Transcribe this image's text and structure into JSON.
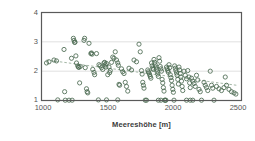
{
  "chart_data": {
    "type": "scatter",
    "title": "",
    "xlabel": "Meereshöhe [m]",
    "ylabel": "Vegetationsindex",
    "xlim": [
      1000,
      2600
    ],
    "ylim": [
      1,
      4
    ],
    "xticks": [
      1000,
      1500,
      2000,
      2500
    ],
    "yticks": [
      1,
      2,
      3,
      4
    ],
    "grid": "horizontal-only",
    "gridlines_y": [
      2,
      3
    ],
    "legend": "none",
    "marker": "open-circle",
    "marker_color": "#4c6a52",
    "trendline": {
      "style": "dashed",
      "color": "#9aaf9c",
      "x": [
        1040,
        2560
      ],
      "y": [
        2.38,
        1.52
      ]
    },
    "points": [
      [
        1040,
        2.28
      ],
      [
        1060,
        2.32
      ],
      [
        1100,
        2.38
      ],
      [
        1120,
        2.35
      ],
      [
        1130,
        1.02
      ],
      [
        1180,
        2.74
      ],
      [
        1185,
        1.3
      ],
      [
        1190,
        1.01
      ],
      [
        1220,
        1.01
      ],
      [
        1240,
        2.44
      ],
      [
        1245,
        1.01
      ],
      [
        1255,
        3.12
      ],
      [
        1260,
        3.05
      ],
      [
        1265,
        2.98
      ],
      [
        1268,
        2.99
      ],
      [
        1275,
        2.52
      ],
      [
        1280,
        2.28
      ],
      [
        1290,
        2.18
      ],
      [
        1295,
        2.14
      ],
      [
        1300,
        2.13
      ],
      [
        1305,
        1.6
      ],
      [
        1310,
        2.16
      ],
      [
        1340,
        3.05
      ],
      [
        1345,
        3.12
      ],
      [
        1350,
        2.12
      ],
      [
        1360,
        1.4
      ],
      [
        1365,
        1.3
      ],
      [
        1370,
        1.26
      ],
      [
        1380,
        2.95
      ],
      [
        1395,
        2.6
      ],
      [
        1400,
        2.62
      ],
      [
        1405,
        2.58
      ],
      [
        1410,
        2.06
      ],
      [
        1420,
        1.96
      ],
      [
        1425,
        1.88
      ],
      [
        1440,
        2.6
      ],
      [
        1460,
        2.22
      ],
      [
        1470,
        2.18
      ],
      [
        1480,
        2.12
      ],
      [
        1490,
        2.06
      ],
      [
        1500,
        2.28
      ],
      [
        1505,
        2.3
      ],
      [
        1510,
        2.22
      ],
      [
        1515,
        2.14
      ],
      [
        1520,
        2.26
      ],
      [
        1530,
        1.88
      ],
      [
        1540,
        2.14
      ],
      [
        1545,
        1.95
      ],
      [
        1550,
        2.02
      ],
      [
        1560,
        2.3
      ],
      [
        1570,
        2.48
      ],
      [
        1580,
        2.44
      ],
      [
        1590,
        2.66
      ],
      [
        1600,
        2.38
      ],
      [
        1610,
        2.28
      ],
      [
        1615,
        2.2
      ],
      [
        1620,
        1.55
      ],
      [
        1625,
        1.52
      ],
      [
        1640,
        2.08
      ],
      [
        1650,
        1.98
      ],
      [
        1660,
        1.92
      ],
      [
        1670,
        1.62
      ],
      [
        1680,
        1.48
      ],
      [
        1690,
        1.32
      ],
      [
        1700,
        2.1
      ],
      [
        1720,
        2.04
      ],
      [
        1740,
        2.38
      ],
      [
        1760,
        2.32
      ],
      [
        1780,
        2.92
      ],
      [
        1790,
        2.66
      ],
      [
        1800,
        2.02
      ],
      [
        1805,
        1.9
      ],
      [
        1810,
        1.62
      ],
      [
        1815,
        1.52
      ],
      [
        1820,
        1.42
      ],
      [
        1830,
        1.01
      ],
      [
        1840,
        1.01
      ],
      [
        1850,
        2.04
      ],
      [
        1855,
        1.98
      ],
      [
        1860,
        1.94
      ],
      [
        1865,
        1.88
      ],
      [
        1870,
        1.82
      ],
      [
        1875,
        1.76
      ],
      [
        1880,
        2.28
      ],
      [
        1885,
        2.18
      ],
      [
        1890,
        2.1
      ],
      [
        1895,
        2.06
      ],
      [
        1900,
        2.4
      ],
      [
        1905,
        2.3
      ],
      [
        1910,
        2.22
      ],
      [
        1915,
        2.14
      ],
      [
        1920,
        2.06
      ],
      [
        1925,
        1.98
      ],
      [
        1930,
        1.9
      ],
      [
        1935,
        1.82
      ],
      [
        1940,
        2.46
      ],
      [
        1945,
        2.34
      ],
      [
        1950,
        2.16
      ],
      [
        1955,
        2.08
      ],
      [
        1960,
        2.0
      ],
      [
        1965,
        1.72
      ],
      [
        1970,
        1.6
      ],
      [
        1975,
        1.44
      ],
      [
        1980,
        1.32
      ],
      [
        1985,
        1.01
      ],
      [
        1990,
        1.01
      ],
      [
        1995,
        1.01
      ],
      [
        2000,
        2.14
      ],
      [
        2005,
        2.08
      ],
      [
        2010,
        2.02
      ],
      [
        2015,
        1.96
      ],
      [
        2020,
        2.22
      ],
      [
        2025,
        2.12
      ],
      [
        2030,
        1.88
      ],
      [
        2035,
        1.78
      ],
      [
        2040,
        1.68
      ],
      [
        2045,
        1.52
      ],
      [
        2050,
        1.38
      ],
      [
        2055,
        1.28
      ],
      [
        2060,
        1.01
      ],
      [
        2065,
        2.18
      ],
      [
        2070,
        2.1
      ],
      [
        2075,
        2.02
      ],
      [
        2080,
        1.94
      ],
      [
        2085,
        1.86
      ],
      [
        2090,
        1.72
      ],
      [
        2095,
        1.56
      ],
      [
        2100,
        2.14
      ],
      [
        2105,
        2.04
      ],
      [
        2110,
        1.92
      ],
      [
        2115,
        1.8
      ],
      [
        2120,
        1.66
      ],
      [
        2125,
        1.48
      ],
      [
        2130,
        1.34
      ],
      [
        2140,
        2.0
      ],
      [
        2150,
        1.86
      ],
      [
        2160,
        1.74
      ],
      [
        2170,
        2.02
      ],
      [
        2180,
        1.8
      ],
      [
        2185,
        1.6
      ],
      [
        2190,
        1.44
      ],
      [
        2200,
        1.76
      ],
      [
        2210,
        1.66
      ],
      [
        2220,
        1.58
      ],
      [
        2230,
        1.48
      ],
      [
        2240,
        1.86
      ],
      [
        2250,
        1.7
      ],
      [
        2260,
        1.38
      ],
      [
        2270,
        1.3
      ],
      [
        2280,
        1.01
      ],
      [
        2300,
        1.62
      ],
      [
        2310,
        1.52
      ],
      [
        2320,
        1.44
      ],
      [
        2330,
        1.34
      ],
      [
        2350,
        2.0
      ],
      [
        2360,
        1.52
      ],
      [
        2370,
        1.42
      ],
      [
        2380,
        1.01
      ],
      [
        2400,
        1.48
      ],
      [
        2420,
        1.4
      ],
      [
        2440,
        1.34
      ],
      [
        2460,
        1.44
      ],
      [
        2470,
        1.8
      ],
      [
        2480,
        1.52
      ],
      [
        2500,
        1.38
      ],
      [
        2520,
        1.3
      ],
      [
        2540,
        1.26
      ],
      [
        2555,
        1.22
      ],
      [
        1455,
        1.02
      ],
      [
        1520,
        1.02
      ],
      [
        1610,
        1.02
      ],
      [
        2160,
        1.01
      ],
      [
        2190,
        1.01
      ],
      [
        2210,
        1.01
      ],
      [
        1935,
        1.01
      ],
      [
        1955,
        1.01
      ]
    ]
  }
}
